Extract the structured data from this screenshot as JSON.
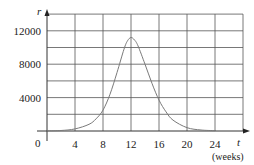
{
  "chart_data": {
    "type": "line",
    "title": "",
    "xlabel": "t",
    "xlabel_unit": "(weeks)",
    "ylabel": "r",
    "xlim": [
      0,
      28
    ],
    "ylim": [
      0,
      14000
    ],
    "grid": true,
    "x_ticks": [
      4,
      8,
      12,
      16,
      20,
      24
    ],
    "x_tick_labels": [
      "4",
      "8",
      "12",
      "16",
      "20",
      "24"
    ],
    "y_ticks": [
      4000,
      8000,
      12000
    ],
    "y_tick_labels": [
      "4000",
      "8000",
      "12000"
    ],
    "origin_label": "0",
    "x_grid_step": 4,
    "y_grid_step": 2000,
    "series": [
      {
        "name": "r(t)",
        "color": "#7a7a7a",
        "x": [
          0,
          2,
          4,
          6,
          7,
          8,
          9,
          10,
          11,
          11.5,
          12,
          12.5,
          13,
          14,
          15,
          16,
          17,
          18,
          20,
          22,
          24
        ],
        "values": [
          20,
          60,
          250,
          800,
          1450,
          2500,
          4400,
          7000,
          9800,
          10800,
          11200,
          10900,
          10200,
          8000,
          5700,
          3700,
          2300,
          1300,
          400,
          120,
          40
        ]
      }
    ]
  }
}
